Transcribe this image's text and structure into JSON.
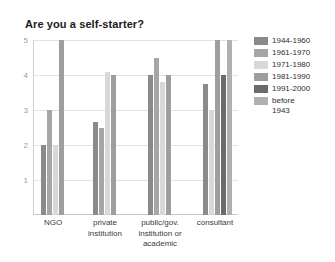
{
  "chart_data": {
    "type": "bar",
    "title": "Are you a self-starter?",
    "xlabel": "",
    "ylabel": "",
    "ylim": [
      0,
      5
    ],
    "yticks": [
      1,
      2,
      3,
      4,
      5
    ],
    "grid": true,
    "legend_position": "right",
    "categories": [
      "NGO",
      "private\ninstitution",
      "public/gov.\ninstitution or\nacademic",
      "consultant"
    ],
    "series": [
      {
        "name": "1944-1960",
        "color": "#8a8a8a",
        "values": [
          2,
          2.65,
          4,
          3.75
        ]
      },
      {
        "name": "1961-1970",
        "color": "#a6a6a6",
        "values": [
          3,
          2.5,
          4.5,
          null
        ]
      },
      {
        "name": "1971-1980",
        "color": "#d8d8d8",
        "values": [
          2,
          4.1,
          3.8,
          3
        ]
      },
      {
        "name": "1981-1990",
        "color": "#9e9e9e",
        "values": [
          5,
          4,
          4,
          5
        ]
      },
      {
        "name": "1991-2000",
        "color": "#6b6b6b",
        "values": [
          null,
          null,
          null,
          4
        ]
      },
      {
        "name": "before\n1943",
        "color": "#b0b0b0",
        "values": [
          null,
          null,
          null,
          5
        ]
      }
    ]
  },
  "legend": {
    "items": [
      {
        "label": "1944-1960",
        "color": "#8a8a8a"
      },
      {
        "label": "1961-1970",
        "color": "#a6a6a6"
      },
      {
        "label": "1971-1980",
        "color": "#d8d8d8"
      },
      {
        "label": "1981-1990",
        "color": "#9e9e9e"
      },
      {
        "label": "1991-2000",
        "color": "#6b6b6b"
      },
      {
        "label": "before\n1943",
        "color": "#b0b0b0"
      }
    ]
  }
}
